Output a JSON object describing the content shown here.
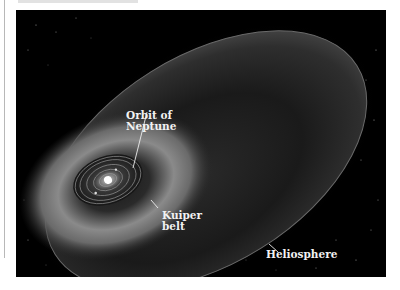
{
  "figure": {
    "labels": {
      "orbit_of_neptune": [
        "Orbit of",
        "Neptune"
      ],
      "kuiper_belt": [
        "Kuiper",
        "belt"
      ],
      "heliosphere": "Heliosphere"
    },
    "colors": {
      "background": "#000000",
      "label_text": "#f2f2f2",
      "page": "#ffffff"
    }
  }
}
